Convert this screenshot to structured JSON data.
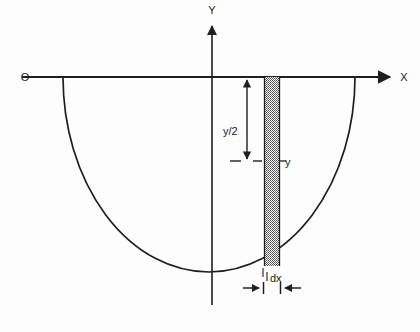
{
  "figure": {
    "type": "geometry-diagram",
    "background_color": "#fdfdfd",
    "ink_color": "#1f1f1f",
    "width": 420,
    "height": 332
  },
  "axes": {
    "origin_label": "O",
    "x_axis_label": "X",
    "y_axis_label": "Y",
    "x_axis": {
      "y": 77,
      "x_start": 22,
      "x_end": 397,
      "arrowhead": "right"
    },
    "y_axis": {
      "x": 212,
      "y_start": 22,
      "y_end": 305,
      "arrowhead": "up"
    },
    "origin_point": {
      "x": 212,
      "y": 77
    }
  },
  "curve": {
    "name": "semicircle",
    "description": "lower semicircular arc below the X axis",
    "left_x": 63,
    "right_x": 355,
    "top_y": 77,
    "bottom_y": 272,
    "center_x": 209,
    "radius_x": 146,
    "radius_y": 195
  },
  "strip": {
    "name": "differential-element-strip",
    "fill_pattern": "stipple",
    "left_x": 264,
    "right_x": 280,
    "top_y": 77,
    "bottom_y": 266
  },
  "annotations": {
    "half_height_label": "y/2",
    "half_height_arrow": {
      "x": 247,
      "top_y": 78,
      "bottom_y": 161,
      "arrowheads": "both"
    },
    "half_height_label_pos": {
      "x": 223,
      "y": 131
    },
    "depth_label": "y",
    "depth_label_pos": {
      "x": 284,
      "y": 166
    },
    "dashed_line": {
      "y": 161,
      "x_start": 230,
      "x_end": 272
    },
    "width_label": "dx",
    "width_label_pos": {
      "x": 271,
      "y": 281
    },
    "width_arrows": {
      "y": 288,
      "left_tail_x": 243,
      "left_head_x": 262,
      "right_tail_x": 300,
      "right_head_x": 281,
      "tick_left_x": 263,
      "tick_right_x": 280
    }
  }
}
